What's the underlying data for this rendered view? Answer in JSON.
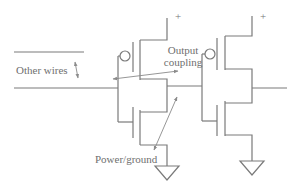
{
  "diagram": {
    "labels": {
      "other_wires": "Other wires",
      "output_coupling_line1": "Output",
      "output_coupling_line2": "coupling",
      "power_ground": "Power/ground",
      "supply_plus_1": "+",
      "supply_plus_2": "+"
    },
    "components": [
      {
        "id": "inverter-1",
        "type": "CMOS inverter",
        "transistors": [
          "PMOS",
          "NMOS"
        ]
      },
      {
        "id": "inverter-2",
        "type": "CMOS inverter",
        "transistors": [
          "PMOS",
          "NMOS"
        ]
      }
    ],
    "colors": {
      "wire": "#7a7a7a",
      "arrow": "#8a8a8a",
      "text": "#6f6f6f",
      "background": "#ffffff"
    }
  }
}
